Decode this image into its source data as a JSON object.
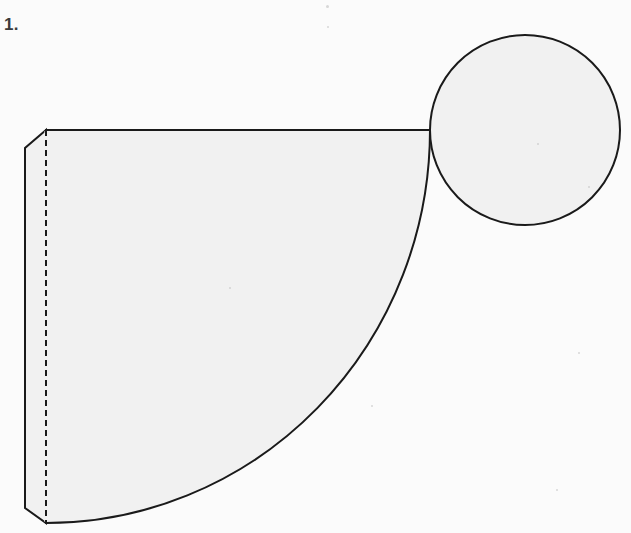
{
  "page": {
    "width": 631,
    "height": 533,
    "background_color": "#fbfbfb",
    "item_number_label": "1."
  },
  "colors": {
    "stroke": "#1a1a1a",
    "fill": "#f1f1f1",
    "label_text": "#3a3a3a",
    "page_background": "#fbfbfb",
    "speck": "#b9b9b9"
  },
  "figure": {
    "name": "cone-net-diagram",
    "stroke_width": 2,
    "parts": [
      {
        "name": "circle-base",
        "shape": "circle",
        "center_x": 525,
        "center_y": 130,
        "radius": 95,
        "filled": true,
        "dashed": false
      },
      {
        "name": "sector-lateral-surface",
        "shape": "sector",
        "apex_x": 46,
        "apex_y": 130,
        "arc_start_x": 430,
        "arc_start_y": 130,
        "arc_end_x": 46,
        "arc_end_y": 523,
        "radius_x": 384,
        "radius_y": 393,
        "filled": true
      },
      {
        "name": "glue-flap",
        "shape": "beveled-strip",
        "top_bevel_from_x": 46,
        "top_bevel_from_y": 130,
        "top_bevel_to_x": 25,
        "top_bevel_to_y": 148,
        "left_edge_x": 25,
        "left_edge_top_y": 148,
        "left_edge_bottom_y": 508,
        "bottom_bevel_to_x": 46,
        "bottom_bevel_to_y": 523,
        "filled": true
      },
      {
        "name": "fold-line",
        "shape": "dashed-vertical-line",
        "x": 46,
        "y_start": 130,
        "y_end": 523,
        "dash_length": 6,
        "gap_length": 4
      },
      {
        "name": "top-edge-line",
        "shape": "horizontal-line",
        "x_start": 46,
        "x_end": 430,
        "y": 130
      }
    ]
  },
  "specks": [
    {
      "name": "speck-top-center",
      "x": 326,
      "y": 5,
      "size": 3
    },
    {
      "name": "speck-top-center-low",
      "x": 327,
      "y": 26,
      "size": 2
    },
    {
      "name": "speck-circle-inner",
      "x": 537,
      "y": 143,
      "size": 2
    },
    {
      "name": "speck-circle-lower",
      "x": 588,
      "y": 186,
      "size": 2
    },
    {
      "name": "speck-right-mid",
      "x": 578,
      "y": 352,
      "size": 2
    },
    {
      "name": "speck-curve-right",
      "x": 371,
      "y": 405,
      "size": 2
    },
    {
      "name": "speck-lower-right",
      "x": 556,
      "y": 489,
      "size": 2
    },
    {
      "name": "speck-sector-mid",
      "x": 229,
      "y": 287,
      "size": 2
    }
  ]
}
